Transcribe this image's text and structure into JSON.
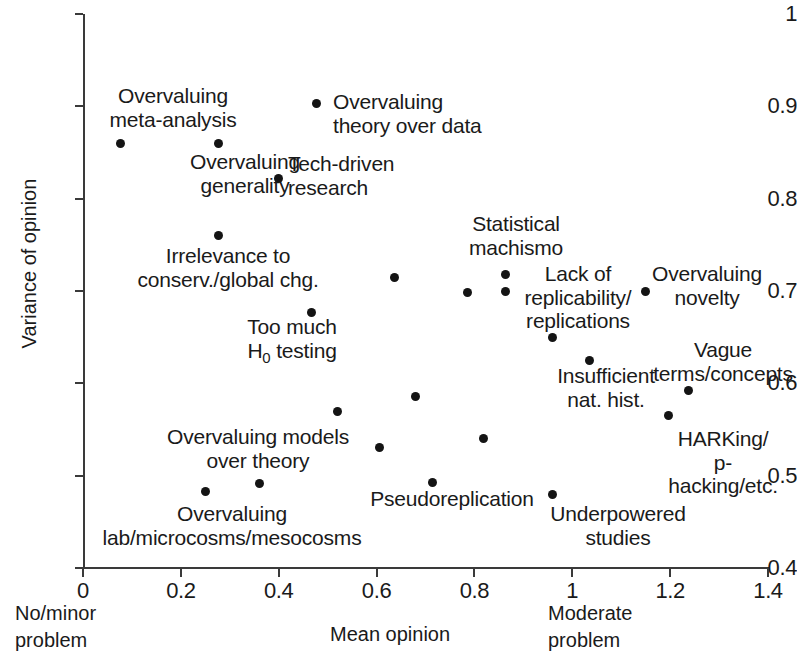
{
  "chart_data": {
    "type": "scatter",
    "title": "",
    "xlabel": "Mean opinion",
    "ylabel": "Variance of opinion",
    "xlim": [
      0,
      1.4
    ],
    "ylim": [
      0.4,
      1
    ],
    "grid": false,
    "legend": "none",
    "x_ticks": [
      "0",
      "0.2",
      "0.4",
      "0.6",
      "0.8",
      "1",
      "1.2",
      "1.4"
    ],
    "x_tick_values": [
      0,
      0.2,
      0.4,
      0.6,
      0.8,
      1.0,
      1.2,
      1.4
    ],
    "y_ticks": [
      "0.4",
      "0.5",
      "0.6",
      "0.7",
      "0.8",
      "0.9",
      "1"
    ],
    "y_tick_values": [
      0.4,
      0.5,
      0.6,
      0.7,
      0.8,
      0.9,
      1.0
    ],
    "x_axis_low_note": "No/minor\nproblem",
    "x_axis_high_note": "Moderate\nproblem",
    "points": [
      {
        "label": "Overvaluing\nmeta-analysis",
        "x": 0.076,
        "y": 0.86
      },
      {
        "label": "Overvaluing\ngenerality",
        "x": 0.276,
        "y": 0.86
      },
      {
        "label": "Overvaluing\ntheory over data",
        "x": 0.477,
        "y": 0.903
      },
      {
        "label": "Tech-driven\nresearch",
        "x": 0.4,
        "y": 0.822
      },
      {
        "label": "Irrelevance to\nconserv./global chg.",
        "x": 0.276,
        "y": 0.76
      },
      {
        "label": "Too much\nH0 testing",
        "x": 0.466,
        "y": 0.677
      },
      {
        "label": "",
        "x": 0.636,
        "y": 0.715
      },
      {
        "label": "Statistical\nmachismo",
        "x": 0.863,
        "y": 0.718
      },
      {
        "label": "",
        "x": 0.785,
        "y": 0.698
      },
      {
        "label": "Lack of\nreplicability/\nreplications",
        "x": 0.863,
        "y": 0.7
      },
      {
        "label": "Overvaluing\nnovelty",
        "x": 1.149,
        "y": 0.7
      },
      {
        "label": "",
        "x": 0.959,
        "y": 0.65
      },
      {
        "label": "Insufficient\nnat. hist.",
        "x": 1.035,
        "y": 0.625
      },
      {
        "label": "Vague\nterms/concepts",
        "x": 1.237,
        "y": 0.592
      },
      {
        "label": "HARKing/\np-hacking/etc.",
        "x": 1.196,
        "y": 0.565
      },
      {
        "label": "",
        "x": 0.679,
        "y": 0.586
      },
      {
        "label": "Overvaluing models\nover theory",
        "x": 0.52,
        "y": 0.57
      },
      {
        "label": "",
        "x": 0.607,
        "y": 0.53
      },
      {
        "label": "",
        "x": 0.818,
        "y": 0.54
      },
      {
        "label": "Pseudoreplication",
        "x": 0.714,
        "y": 0.493
      },
      {
        "label": "Overvaluing\nlab/microcosms/mesocosms",
        "x": 0.25,
        "y": 0.483
      },
      {
        "label": "",
        "x": 0.36,
        "y": 0.492
      },
      {
        "label": "Underpowered\nstudies",
        "x": 0.959,
        "y": 0.48
      }
    ]
  },
  "axes": {
    "y_title": "Variance of opinion",
    "x_title": "Mean opinion",
    "x_note_low": "No/minor\nproblem",
    "x_note_high": "Moderate\nproblem"
  },
  "labels": {
    "overvaluing_meta_analysis": "Overvaluing\nmeta-analysis",
    "overvaluing_generality": "Overvaluing\ngenerality",
    "overvaluing_theory_over_data": "Overvaluing\ntheory over data",
    "tech_driven_research": "Tech-driven\nresearch",
    "irrelevance_conservation": "Irrelevance to\nconserv./global chg.",
    "too_much_testing_line1": "Too much",
    "too_much_testing_line2_pre": "H",
    "too_much_testing_line2_sub": "0",
    "too_much_testing_line2_post": " testing",
    "statistical_machismo": "Statistical\nmachismo",
    "lack_of_replicability": "Lack of\nreplicability/\nreplications",
    "overvaluing_novelty": "Overvaluing\nnovelty",
    "insufficient_nat_hist": "Insufficient\nnat. hist.",
    "vague_terms_concepts": "Vague\nterms/concepts",
    "harking_p_hacking": "HARKing/\np-hacking/etc.",
    "overvaluing_models_over_theory": "Overvaluing models\nover theory",
    "pseudoreplication": "Pseudoreplication",
    "overvaluing_lab_microcosms": "Overvaluing\nlab/microcosms/mesocosms",
    "underpowered_studies": "Underpowered\nstudies"
  },
  "colors": {
    "point": "#141414",
    "axis": "#3a3a3a",
    "text": "#1a1a1a",
    "background": "#ffffff"
  }
}
